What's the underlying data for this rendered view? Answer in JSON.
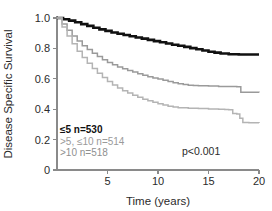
{
  "chart_data": {
    "type": "line",
    "title": "",
    "xlabel": "Time (years)",
    "ylabel": "Disease Specific Survival",
    "xlim": [
      0,
      20
    ],
    "ylim": [
      0,
      1.0
    ],
    "xticks": [
      "5",
      "10",
      "15",
      "20"
    ],
    "xtick_values": [
      5,
      10,
      15,
      20
    ],
    "yticks": [
      "0",
      "0.2",
      "0.4",
      "0.6",
      "0.8",
      "1.0"
    ],
    "ytick_values": [
      0,
      0.2,
      0.4,
      0.6,
      0.8,
      1.0
    ],
    "grid": false,
    "legend_position": "lower-left",
    "annotation": "p<0.001",
    "series": [
      {
        "name": "≤5 n=530",
        "label": "≤5 n=530",
        "group": "≤5",
        "n": 530,
        "color": "#111111",
        "final_survival": 0.76,
        "x": [
          0,
          0.6,
          1.2,
          1.8,
          2.4,
          3.0,
          3.6,
          4.2,
          4.8,
          5.4,
          6.0,
          6.6,
          7.2,
          7.8,
          8.4,
          9.0,
          9.6,
          10.2,
          10.8,
          11.4,
          12.0,
          12.6,
          13.2,
          13.8,
          14.4,
          15.0,
          15.6,
          16.2,
          17.0,
          18.0,
          19.0,
          20.0
        ],
        "y": [
          1.0,
          0.992,
          0.983,
          0.972,
          0.96,
          0.948,
          0.936,
          0.925,
          0.915,
          0.905,
          0.896,
          0.888,
          0.88,
          0.872,
          0.864,
          0.856,
          0.848,
          0.84,
          0.832,
          0.824,
          0.817,
          0.81,
          0.802,
          0.794,
          0.786,
          0.778,
          0.772,
          0.766,
          0.762,
          0.76,
          0.76,
          0.76
        ]
      },
      {
        "name": ">5, ≤10 n=514",
        "label": ">5, ≤10 n=514",
        "group": ">5, ≤10",
        "n": 514,
        "color": "#9a9a9a",
        "final_survival": 0.51,
        "x": [
          0,
          0.5,
          1.0,
          1.5,
          2.0,
          2.5,
          3.0,
          3.5,
          4.0,
          4.5,
          5.0,
          5.5,
          6.0,
          6.5,
          7.0,
          7.5,
          8.0,
          8.5,
          9.0,
          9.5,
          10.0,
          10.5,
          11.0,
          11.5,
          12.0,
          12.5,
          13.0,
          13.5,
          14.0,
          15.0,
          16.0,
          17.0,
          17.8,
          18.2,
          19.0,
          20.0
        ],
        "y": [
          1.0,
          0.96,
          0.92,
          0.882,
          0.848,
          0.818,
          0.792,
          0.768,
          0.746,
          0.726,
          0.708,
          0.692,
          0.678,
          0.666,
          0.654,
          0.644,
          0.634,
          0.624,
          0.614,
          0.606,
          0.598,
          0.59,
          0.582,
          0.574,
          0.568,
          0.562,
          0.558,
          0.556,
          0.554,
          0.552,
          0.55,
          0.549,
          0.548,
          0.512,
          0.511,
          0.51
        ]
      },
      {
        "name": ">10 n=518",
        "label": ">10 n=518",
        "group": ">10",
        "n": 518,
        "color": "#b4b4b4",
        "final_survival": 0.31,
        "x": [
          0,
          0.5,
          1.0,
          1.5,
          2.0,
          2.5,
          3.0,
          3.5,
          4.0,
          4.5,
          5.0,
          5.5,
          6.0,
          6.5,
          7.0,
          7.5,
          8.0,
          8.5,
          9.0,
          9.5,
          10.0,
          10.5,
          11.0,
          11.5,
          12.0,
          13.0,
          14.0,
          15.0,
          16.0,
          16.6,
          17.0,
          17.4,
          17.8,
          18.1,
          18.4,
          19.0,
          20.0
        ],
        "y": [
          1.0,
          0.94,
          0.882,
          0.83,
          0.782,
          0.74,
          0.702,
          0.668,
          0.636,
          0.608,
          0.582,
          0.56,
          0.54,
          0.522,
          0.506,
          0.492,
          0.478,
          0.466,
          0.456,
          0.446,
          0.436,
          0.428,
          0.42,
          0.414,
          0.41,
          0.406,
          0.404,
          0.402,
          0.4,
          0.398,
          0.396,
          0.372,
          0.368,
          0.34,
          0.312,
          0.311,
          0.31
        ]
      }
    ]
  },
  "legend": {
    "items": [
      {
        "label": "≤5 n=530",
        "color": "#111111",
        "bold": true
      },
      {
        "label": ">5, ≤10 n=514",
        "color": "#9a9a9a",
        "bold": false
      },
      {
        "label": ">10 n=518",
        "color": "#8f8f8f",
        "bold": false
      }
    ]
  },
  "annotation": {
    "pvalue": "p<0.001"
  },
  "axes": {
    "x_title": "Time (years)",
    "y_title": "Disease Specific Survival"
  }
}
